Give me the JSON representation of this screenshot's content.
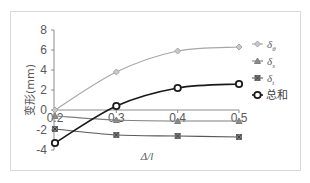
{
  "chart_data": {
    "type": "line",
    "title": "",
    "xlabel": "Δ/l",
    "ylabel": "变形(mm)",
    "x": [
      0.2,
      0.3,
      0.4,
      0.5
    ],
    "x_tick_labels": [
      "0.2",
      "0.3",
      "0.4",
      "0.5"
    ],
    "y_tick_labels": [
      "8",
      "6",
      "4",
      "2",
      "0",
      "-2",
      "-4"
    ],
    "ylim": [
      -4,
      8
    ],
    "xlim": [
      0.2,
      0.5
    ],
    "grid": false,
    "legend_position": "right",
    "series": [
      {
        "name": "δθ",
        "label_main": "δ",
        "label_sub": "θ",
        "marker": "diamond",
        "color": "#a6a6a6",
        "values": [
          0.0,
          3.8,
          5.9,
          6.3
        ]
      },
      {
        "name": "δs",
        "label_main": "δ",
        "label_sub": "s",
        "marker": "triangle",
        "color": "#7f7f7f",
        "values": [
          -0.6,
          -1.0,
          -1.1,
          -1.1
        ]
      },
      {
        "name": "δt",
        "label_main": "δ",
        "label_sub": "t",
        "marker": "x-square",
        "color": "#595959",
        "values": [
          -1.9,
          -2.5,
          -2.6,
          -2.7
        ]
      },
      {
        "name": "总和",
        "label_main": "总和",
        "label_sub": "",
        "marker": "circle",
        "color": "#1a1a1a",
        "values": [
          -3.3,
          0.4,
          2.2,
          2.6
        ]
      }
    ]
  }
}
